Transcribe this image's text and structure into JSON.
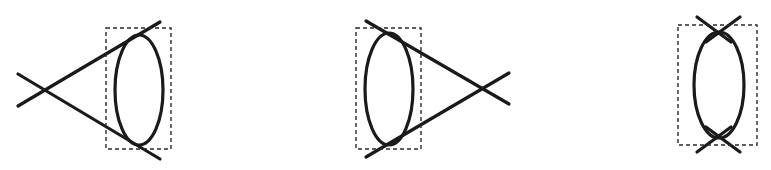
{
  "figure": {
    "type": "feynman-diagrams",
    "stroke_color": "#1a1a1a",
    "box_color": "#2a2a2a",
    "background": "#ffffff"
  },
  "diagrams": [
    {
      "id": "left",
      "vertex": {
        "x": 45,
        "y": 90
      },
      "lines": [
        {
          "x1": 18,
          "y1": 106,
          "x2": 160,
          "y2": 22
        },
        {
          "x1": 18,
          "y1": 74,
          "x2": 160,
          "y2": 159
        }
      ],
      "loop": {
        "cx": 139,
        "cy": 90,
        "rx": 24,
        "ry": 55
      },
      "box": {
        "x": 106,
        "y": 28,
        "width": 65,
        "height": 121
      }
    },
    {
      "id": "middle",
      "vertex": {
        "x": 482,
        "y": 89
      },
      "lines": [
        {
          "x1": 366,
          "y1": 21,
          "x2": 509,
          "y2": 104
        },
        {
          "x1": 366,
          "y1": 157,
          "x2": 509,
          "y2": 73
        }
      ],
      "loop": {
        "cx": 389,
        "cy": 89,
        "rx": 24,
        "ry": 56
      },
      "box": {
        "x": 356,
        "y": 28,
        "width": 65,
        "height": 121
      }
    },
    {
      "id": "right",
      "vertex_top": {
        "x": 718,
        "y": 32
      },
      "vertex_bottom": {
        "x": 719,
        "y": 137
      },
      "lines": [
        {
          "x1": 697,
          "y1": 17,
          "x2": 731,
          "y2": 42
        },
        {
          "x1": 740,
          "y1": 17,
          "x2": 706,
          "y2": 42
        },
        {
          "x1": 697,
          "y1": 152,
          "x2": 731,
          "y2": 127
        },
        {
          "x1": 740,
          "y1": 152,
          "x2": 706,
          "y2": 127
        }
      ],
      "loop": {
        "cx": 719,
        "cy": 85,
        "rx": 25,
        "ry": 53
      },
      "box": {
        "x": 678,
        "y": 25,
        "width": 79,
        "height": 120
      }
    }
  ]
}
